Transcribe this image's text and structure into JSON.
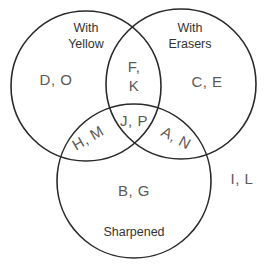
{
  "diagram": {
    "type": "venn-3",
    "sets": [
      {
        "id": "yellow",
        "label_lines": [
          "With",
          "Yellow"
        ]
      },
      {
        "id": "erasers",
        "label_lines": [
          "With",
          "Erasers"
        ]
      },
      {
        "id": "sharpened",
        "label_lines": [
          "Sharpened"
        ]
      }
    ],
    "regions": {
      "yellow_only": "D, O",
      "erasers_only": "C, E",
      "sharpened_only": "B, G",
      "yellow_erasers": [
        "F,",
        "K"
      ],
      "yellow_sharpened": "H, M",
      "erasers_sharpened": "A, N",
      "all_three": "J, P",
      "outside": "I, L"
    },
    "stroke_color": "#2a2a2a",
    "text_color": "#5a5a5a"
  }
}
